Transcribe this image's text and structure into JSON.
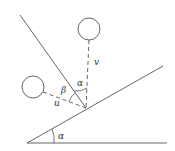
{
  "diagram": {
    "type": "physics-incline-collision",
    "labels": {
      "alpha_base": "α",
      "alpha_top": "α",
      "beta": "β",
      "u": "u",
      "v": "v"
    },
    "colors": {
      "stroke": "#555555",
      "text": "#333333",
      "background": "#ffffff"
    }
  }
}
